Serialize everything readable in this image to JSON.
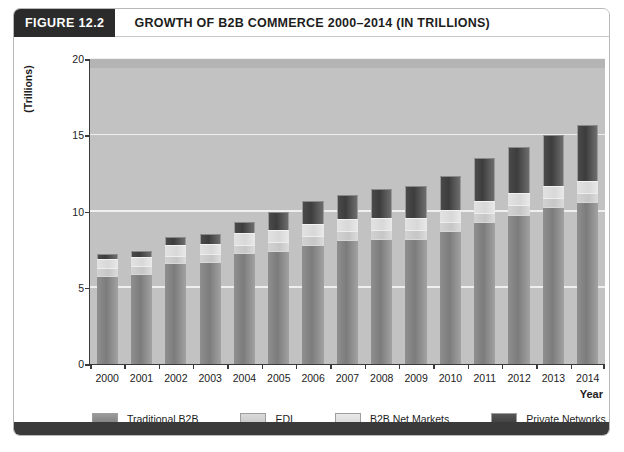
{
  "figure": {
    "tag": "FIGURE 12.2",
    "title": "GROWTH OF B2B COMMERCE 2000–2014 (IN TRILLIONS)"
  },
  "axes": {
    "y_title": "(Trillions)",
    "x_title": "Year",
    "y_ticks": [
      "0",
      "5",
      "10",
      "15",
      "20"
    ]
  },
  "colors": {
    "traditional_b2b": "#7c7c7c",
    "edi": "#c6c6c6",
    "b2b_net_markets": "#d8d8d8",
    "private_networks": "#3d3d3d",
    "plot_background": "#c2c2c2",
    "gridline": "#efefef",
    "axis": "#3a3a3a",
    "header_tag_background": "#2b2b2b",
    "bottom_bar": "#3a3a3a"
  },
  "legend": {
    "items": [
      {
        "label": "Traditional B2B",
        "key": "traditional_b2b"
      },
      {
        "label": "EDI",
        "key": "edi"
      },
      {
        "label": "B2B Net Markets",
        "key": "b2b_net_markets"
      },
      {
        "label": "Private Networks",
        "key": "private_networks"
      }
    ]
  },
  "chart_data": {
    "type": "bar",
    "subtype": "stacked",
    "title": "GROWTH OF B2B COMMERCE 2000–2014 (IN TRILLIONS)",
    "xlabel": "Year",
    "ylabel": "(Trillions)",
    "ylim": [
      0,
      20
    ],
    "yticks": [
      0,
      5,
      10,
      15,
      20
    ],
    "grid": true,
    "legend_position": "bottom",
    "units": "trillions of dollars",
    "categories": [
      "2000",
      "2001",
      "2002",
      "2003",
      "2004",
      "2005",
      "2006",
      "2007",
      "2008",
      "2009",
      "2010",
      "2011",
      "2012",
      "2013",
      "2014"
    ],
    "series": [
      {
        "name": "Traditional B2B",
        "values": [
          5.8,
          5.9,
          6.6,
          6.7,
          7.3,
          7.4,
          7.8,
          8.1,
          8.2,
          8.2,
          8.7,
          9.3,
          9.8,
          10.3,
          10.6
        ]
      },
      {
        "name": "EDI",
        "values": [
          0.5,
          0.5,
          0.5,
          0.5,
          0.5,
          0.6,
          0.6,
          0.6,
          0.6,
          0.6,
          0.6,
          0.6,
          0.6,
          0.6,
          0.6
        ]
      },
      {
        "name": "B2B Net Markets",
        "values": [
          0.6,
          0.6,
          0.7,
          0.7,
          0.8,
          0.8,
          0.8,
          0.8,
          0.8,
          0.8,
          0.8,
          0.8,
          0.8,
          0.8,
          0.8
        ]
      },
      {
        "name": "Private Networks",
        "values": [
          0.3,
          0.4,
          0.5,
          0.6,
          0.7,
          1.2,
          1.5,
          1.6,
          1.9,
          2.1,
          2.2,
          2.8,
          3.0,
          3.3,
          3.7
        ]
      }
    ],
    "totals": [
      7.2,
      7.4,
      8.3,
      8.5,
      9.3,
      10.0,
      10.7,
      11.1,
      11.5,
      11.7,
      12.3,
      13.5,
      14.2,
      15.0,
      15.7
    ]
  }
}
